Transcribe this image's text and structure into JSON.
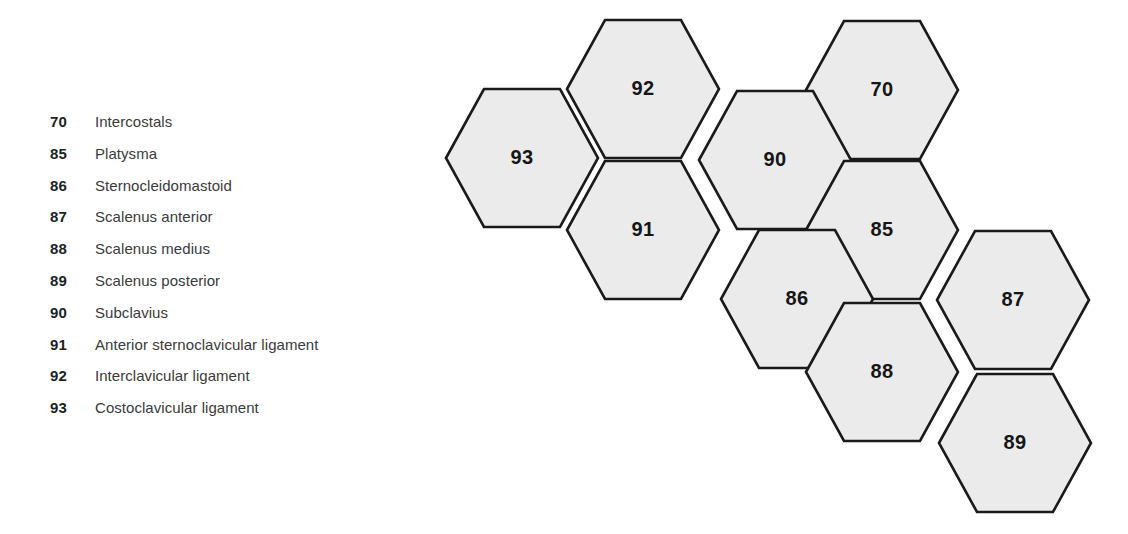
{
  "legend": {
    "items": [
      {
        "number": "70",
        "label": "Intercostals"
      },
      {
        "number": "85",
        "label": "Platysma"
      },
      {
        "number": "86",
        "label": "Sternocleidomastoid"
      },
      {
        "number": "87",
        "label": "Scalenus anterior"
      },
      {
        "number": "88",
        "label": "Scalenus medius"
      },
      {
        "number": "89",
        "label": "Scalenus posterior"
      },
      {
        "number": "90",
        "label": "Subclavius"
      },
      {
        "number": "91",
        "label": "Anterior sternoclavicular ligament"
      },
      {
        "number": "92",
        "label": "Interclavicular ligament"
      },
      {
        "number": "93",
        "label": "Costoclavicular ligament"
      }
    ]
  },
  "diagram": {
    "type": "hex-grid",
    "hex_width": 152,
    "hex_height": 138,
    "fill_color": "#ebebeb",
    "stroke_color": "#1a1a1a",
    "cells": [
      {
        "number": "92",
        "cx": 643,
        "cy": 89
      },
      {
        "number": "70",
        "cx": 882,
        "cy": 90
      },
      {
        "number": "93",
        "cx": 522,
        "cy": 158
      },
      {
        "number": "90",
        "cx": 775,
        "cy": 160
      },
      {
        "number": "91",
        "cx": 643,
        "cy": 230
      },
      {
        "number": "85",
        "cx": 882,
        "cy": 230
      },
      {
        "number": "86",
        "cx": 797,
        "cy": 299
      },
      {
        "number": "87",
        "cx": 1013,
        "cy": 300
      },
      {
        "number": "88",
        "cx": 882,
        "cy": 372
      },
      {
        "number": "89",
        "cx": 1015,
        "cy": 443
      }
    ]
  }
}
